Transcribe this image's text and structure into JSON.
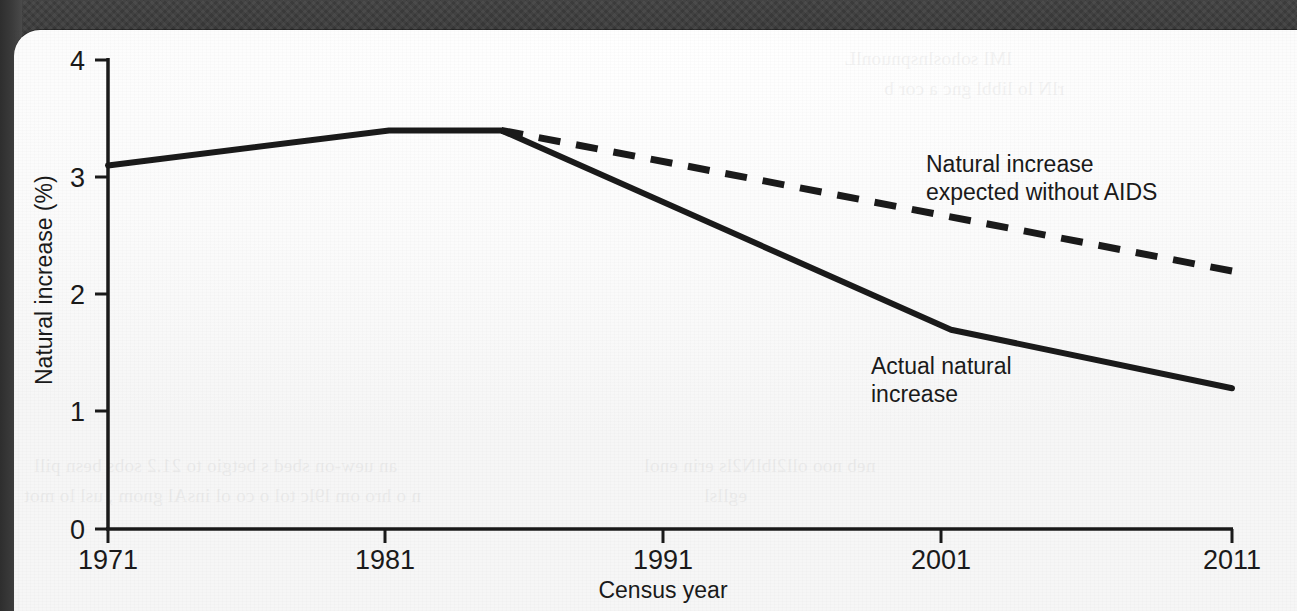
{
  "chart_data": {
    "type": "line",
    "title": "",
    "xlabel": "Census year",
    "ylabel": "Natural increase (%)",
    "xlim": [
      1971,
      2011
    ],
    "ylim": [
      0,
      4
    ],
    "xticks": [
      "1971",
      "1981",
      "1991",
      "2001",
      "2011"
    ],
    "xtick_values": [
      1971,
      1981,
      1991,
      2001,
      2011
    ],
    "yticks": [
      "0",
      "1",
      "2",
      "3",
      "4"
    ],
    "ytick_values": [
      0,
      1,
      2,
      3,
      4
    ],
    "grid": false,
    "legend": "annotated-inline",
    "series": [
      {
        "name": "Actual natural increase",
        "style": "solid",
        "color": "#1a1a1a",
        "points": [
          {
            "x": 1971,
            "y": 3.1
          },
          {
            "x": 1981,
            "y": 3.4
          },
          {
            "x": 1985,
            "y": 3.4
          },
          {
            "x": 2001,
            "y": 1.7
          },
          {
            "x": 2011,
            "y": 1.2
          }
        ]
      },
      {
        "name": "Natural increase expected without AIDS",
        "style": "dashed",
        "color": "#1a1a1a",
        "points": [
          {
            "x": 1985,
            "y": 3.4
          },
          {
            "x": 2011,
            "y": 2.2
          }
        ]
      }
    ],
    "annotations": [
      {
        "id": "expected-label",
        "lines": [
          "Natural increase",
          "expected without AIDS"
        ],
        "x": 1104,
        "y": 163
      },
      {
        "id": "actual-label",
        "lines": [
          "Actual natural",
          "increase"
        ],
        "x": 871,
        "y": 366
      }
    ]
  },
  "axes": {
    "y_label": "Natural increase (%)",
    "x_label": "Census year",
    "y_tick_labels": [
      "4",
      "3",
      "2",
      "1",
      "0"
    ],
    "x_tick_labels": [
      "1971",
      "1981",
      "1991",
      "2001",
      "2011"
    ]
  },
  "annotations": {
    "expected_line1": "Natural increase",
    "expected_line2": "expected without AIDS",
    "actual_line1": "Actual natural",
    "actual_line2": "increase"
  },
  "scan": {
    "ghost_row1": "an uew-on sbed s betgio to 21.2  sobs  besn pill",
    "ghost_row2": "n o  hro om l9lc tol  o co ol insAl gnom , usl lo mot",
    "ghost_row3": "neb  noo oll2lblN2ls erin  enol",
    "ghost_row4": "egllsl",
    "ghost_top1": "lMl  sohoslnspnuonlL",
    "ghost_top2": "rlN  lo libbl gnc a cor b"
  },
  "colors": {
    "ink": "#1a1a1a",
    "paper": "#fbfbfb",
    "band": "#363636"
  }
}
